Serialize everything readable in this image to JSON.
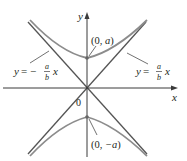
{
  "diagram": {
    "type": "hyperbola",
    "axes": {
      "x_label": "x",
      "y_label": "y",
      "origin_label": "0"
    },
    "vertices": [
      {
        "label": "(0, a)",
        "prefix": "(0, ",
        "var": "a",
        "suffix": ")"
      },
      {
        "label": "(0, −a)",
        "prefix": "(0, ",
        "var": "−a",
        "suffix": ")"
      }
    ],
    "asymptotes": [
      {
        "label": "y = −(a/b) x",
        "lhs": "y",
        "eq": " = −",
        "num": "a",
        "den": "b",
        "var": "x"
      },
      {
        "label": "y = (a/b) x",
        "lhs": "y",
        "eq": " = ",
        "num": "a",
        "den": "b",
        "var": "x"
      }
    ],
    "colors": {
      "axes": "#3a3a3a",
      "asymptotes": "#555555",
      "hyperbola": "#8c8c8c",
      "text": "#231f20"
    }
  }
}
